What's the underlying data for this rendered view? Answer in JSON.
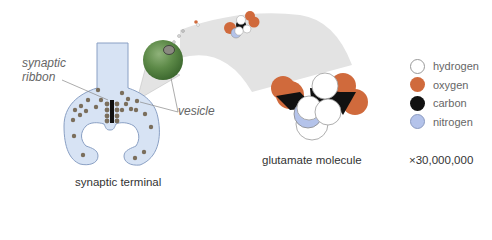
{
  "diagram": {
    "labels": {
      "synaptic_ribbon_line1": "synaptic",
      "synaptic_ribbon_line2": "ribbon",
      "vesicle": "vesicle",
      "synaptic_terminal": "synaptic terminal",
      "glutamate_molecule": "glutamate molecule",
      "magnification": "×30,000,000"
    },
    "legend": [
      {
        "label": "hydrogen",
        "color": "#ffffff"
      },
      {
        "label": "oxygen",
        "color": "#d06a3c"
      },
      {
        "label": "carbon",
        "color": "#111111"
      },
      {
        "label": "nitrogen",
        "color": "#b4c3ea"
      }
    ],
    "colors": {
      "terminal_fill": "#d7e3f4",
      "vesicle_green": "#5d8a48",
      "zoom_cone": "#e4e4e4"
    }
  }
}
